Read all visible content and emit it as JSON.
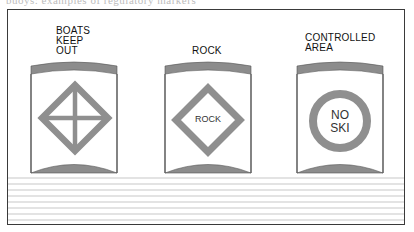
{
  "caption_partial": "buoys: examples of regulatory markers",
  "colors": {
    "frame": "#3a3a3a",
    "buoy_band": "#8c8c8c",
    "symbol": "#8f8f8f",
    "water_lines": "#e3e3e3",
    "text": "#111111"
  },
  "buoys": [
    {
      "label_lines": [
        "BOATS",
        "KEEP",
        "OUT"
      ],
      "symbol": "diamond-with-cross",
      "symbol_text": ""
    },
    {
      "label_lines": [
        "ROCK"
      ],
      "symbol": "diamond",
      "symbol_text": "ROCK"
    },
    {
      "label_lines": [
        "CONTROLLED",
        "AREA"
      ],
      "symbol": "circle",
      "symbol_text_lines": [
        "NO",
        "SKI"
      ]
    }
  ]
}
